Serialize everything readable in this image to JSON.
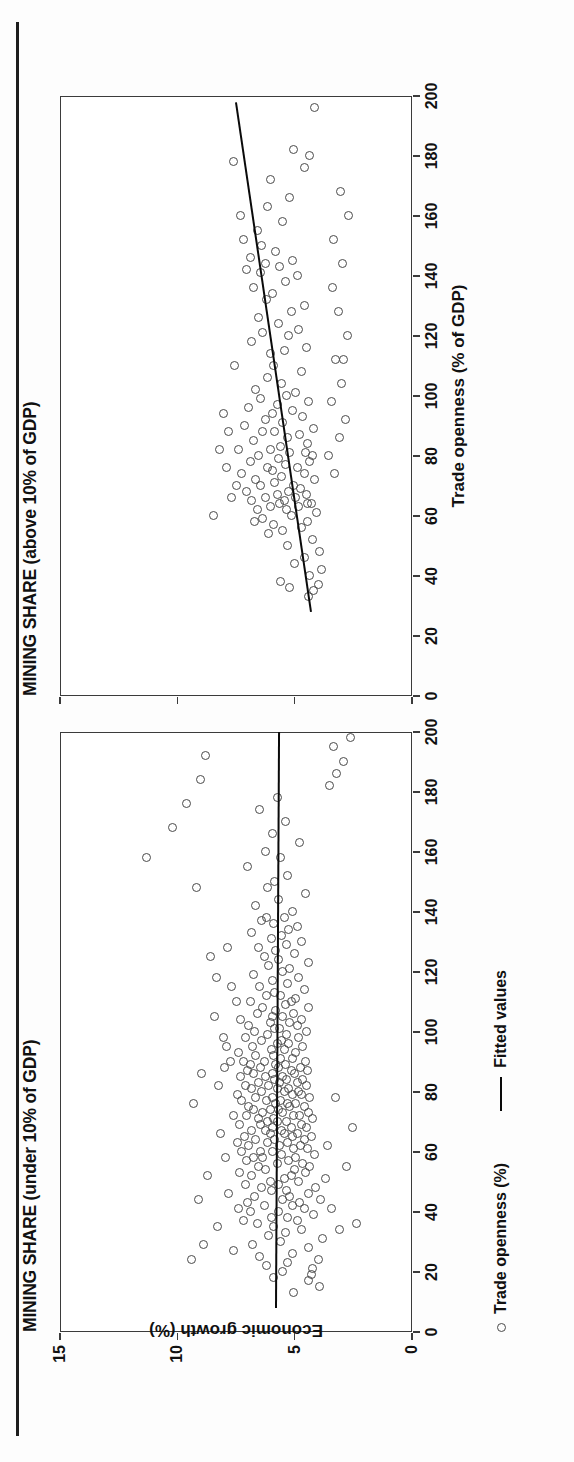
{
  "figure": {
    "xaxis_title": "Trade openness (% of GDP)",
    "yaxis_title": "Economic growth (%)"
  },
  "legend": {
    "items": [
      {
        "label": "Trade openness (%)",
        "marker": "circle-marker-icon"
      },
      {
        "label": "Fitted values",
        "marker": "line-marker-icon"
      }
    ]
  },
  "chart_data": [
    {
      "type": "scatter",
      "title": "MINING SHARE (under 10% of GDP)",
      "xlabel": "Trade openness (%)",
      "ylabel": "Economic growth (%)",
      "xlim": [
        0,
        200
      ],
      "ylim": [
        0,
        15
      ],
      "xticks": [
        0,
        20,
        40,
        60,
        80,
        100,
        120,
        140,
        160,
        180,
        200
      ],
      "yticks": [
        0,
        5,
        10,
        15
      ],
      "grid": false,
      "fit_line": {
        "x": [
          8,
          200
        ],
        "y": [
          5.85,
          5.72
        ]
      },
      "x": [
        13,
        15,
        17,
        18,
        19,
        20,
        21,
        22,
        23,
        24,
        25,
        26,
        27,
        28,
        29,
        30,
        31,
        32,
        33,
        34,
        35,
        35,
        36,
        37,
        37,
        38,
        38,
        39,
        40,
        40,
        41,
        41,
        42,
        42,
        43,
        43,
        44,
        44,
        45,
        45,
        46,
        46,
        47,
        47,
        48,
        48,
        49,
        49,
        50,
        50,
        51,
        51,
        52,
        52,
        53,
        53,
        54,
        54,
        55,
        55,
        56,
        56,
        57,
        57,
        58,
        58,
        58,
        59,
        59,
        60,
        60,
        60,
        61,
        61,
        62,
        62,
        62,
        63,
        63,
        63,
        64,
        64,
        64,
        65,
        65,
        65,
        66,
        66,
        66,
        67,
        67,
        67,
        68,
        68,
        68,
        69,
        69,
        69,
        70,
        70,
        70,
        71,
        71,
        71,
        72,
        72,
        72,
        73,
        73,
        73,
        74,
        74,
        74,
        75,
        75,
        75,
        76,
        76,
        76,
        77,
        77,
        77,
        78,
        78,
        78,
        79,
        79,
        79,
        80,
        80,
        80,
        81,
        81,
        81,
        82,
        82,
        82,
        83,
        83,
        83,
        84,
        84,
        84,
        85,
        85,
        85,
        86,
        86,
        86,
        87,
        87,
        87,
        88,
        88,
        88,
        89,
        89,
        89,
        90,
        90,
        90,
        91,
        91,
        92,
        92,
        93,
        93,
        94,
        94,
        95,
        95,
        96,
        96,
        97,
        97,
        98,
        98,
        99,
        99,
        100,
        100,
        101,
        101,
        102,
        102,
        103,
        103,
        104,
        104,
        105,
        105,
        106,
        106,
        107,
        108,
        108,
        109,
        110,
        110,
        111,
        112,
        112,
        113,
        114,
        115,
        116,
        117,
        118,
        119,
        120,
        121,
        122,
        123,
        124,
        125,
        126,
        127,
        128,
        129,
        130,
        131,
        132,
        133,
        134,
        135,
        136,
        137,
        138,
        140,
        142,
        144,
        146,
        148,
        150,
        152,
        155,
        158,
        160,
        163,
        166,
        170,
        174,
        178,
        182,
        186,
        190,
        195,
        198,
        34,
        36,
        41,
        55,
        62,
        68,
        78,
        88,
        95,
        105,
        115,
        125,
        58,
        66,
        72,
        82,
        90,
        98,
        110,
        118,
        128,
        138,
        148,
        158,
        168,
        176,
        184,
        192,
        24,
        29,
        44,
        52,
        76,
        86,
        102,
        112,
        122,
        132,
        142,
        152
      ],
      "y": [
        5.05,
        3.95,
        4.4,
        5.9,
        4.3,
        5.5,
        4.25,
        6.2,
        5.3,
        4.0,
        6.5,
        5.1,
        7.6,
        4.4,
        6.8,
        5.6,
        3.8,
        6.1,
        5.4,
        4.7,
        8.3,
        5.9,
        6.6,
        4.9,
        7.2,
        5.3,
        6.0,
        4.2,
        6.9,
        5.7,
        4.6,
        7.4,
        5.1,
        6.3,
        4.8,
        7.0,
        5.5,
        3.9,
        6.7,
        5.2,
        4.4,
        7.8,
        6.0,
        5.35,
        4.1,
        6.4,
        5.7,
        7.1,
        4.85,
        6.05,
        5.45,
        3.7,
        6.85,
        5.15,
        4.55,
        7.35,
        6.25,
        5.0,
        4.35,
        6.55,
        5.75,
        4.65,
        7.05,
        5.25,
        6.35,
        4.95,
        6.75,
        5.55,
        4.15,
        7.25,
        5.95,
        6.45,
        5.05,
        4.45,
        6.95,
        5.65,
        4.75,
        7.45,
        6.15,
        5.3,
        4.6,
        6.65,
        5.85,
        5.1,
        4.3,
        7.15,
        6.05,
        5.45,
        4.9,
        6.85,
        5.55,
        6.25,
        4.5,
        5.95,
        5.15,
        6.45,
        4.7,
        7.35,
        5.75,
        6.15,
        5.35,
        4.25,
        6.55,
        5.9,
        5.05,
        4.8,
        7.05,
        6.35,
        5.5,
        4.4,
        6.75,
        5.7,
        6.05,
        5.2,
        4.6,
        6.95,
        5.8,
        5.3,
        4.95,
        7.25,
        6.2,
        5.6,
        4.35,
        6.65,
        5.95,
        5.1,
        4.7,
        7.45,
        6.4,
        5.45,
        4.85,
        6.85,
        5.75,
        5.25,
        4.5,
        7.1,
        6.1,
        5.65,
        4.9,
        6.55,
        5.85,
        5.35,
        4.65,
        7.3,
        6.25,
        5.5,
        5.0,
        6.75,
        5.95,
        5.15,
        4.45,
        7.0,
        6.45,
        5.7,
        4.75,
        6.9,
        5.8,
        5.4,
        4.55,
        7.2,
        6.3,
        5.6,
        5.1,
        6.65,
        5.9,
        4.95,
        7.4,
        6.0,
        5.45,
        4.65,
        6.8,
        5.75,
        5.25,
        6.4,
        5.55,
        4.85,
        7.1,
        6.15,
        5.35,
        4.5,
        6.7,
        5.85,
        5.65,
        4.9,
        6.95,
        6.05,
        5.2,
        4.7,
        7.3,
        5.95,
        5.5,
        5.05,
        6.6,
        5.8,
        4.4,
        6.35,
        5.4,
        6.9,
        5.15,
        4.95,
        6.2,
        5.6,
        5.85,
        4.6,
        6.5,
        5.3,
        5.95,
        4.85,
        6.75,
        5.5,
        5.2,
        6.1,
        4.4,
        5.7,
        6.3,
        5.0,
        5.8,
        6.55,
        5.35,
        4.7,
        6.0,
        5.55,
        6.85,
        5.25,
        4.9,
        5.9,
        6.4,
        5.45,
        5.1,
        6.65,
        5.7,
        4.55,
        6.15,
        5.85,
        5.3,
        7.0,
        5.6,
        6.25,
        4.8,
        5.95,
        5.4,
        6.5,
        5.75,
        3.5,
        3.2,
        2.9,
        3.35,
        2.6,
        3.1,
        2.35,
        3.45,
        2.8,
        3.6,
        2.55,
        3.25,
        8.0,
        7.9,
        8.4,
        7.7,
        8.6,
        7.95,
        8.15,
        7.6,
        8.25,
        7.75,
        8.05,
        7.5,
        8.35,
        7.85,
        6.2,
        9.2,
        11.3,
        10.2,
        9.6,
        9.0,
        8.8,
        9.4,
        8.9,
        9.1,
        8.7,
        9.3,
        8.95
      ]
    },
    {
      "type": "scatter",
      "title": "MINING SHARE (above 10% of GDP)",
      "xlabel": "Trade openness (% of GDP)",
      "ylabel": "Economic growth (%)",
      "xlim": [
        0,
        200
      ],
      "ylim": [
        0,
        15
      ],
      "xticks": [
        0,
        20,
        40,
        60,
        80,
        100,
        120,
        140,
        160,
        180,
        200
      ],
      "yticks": [
        0,
        5,
        10,
        15
      ],
      "grid": false,
      "fit_line": {
        "x": [
          28,
          198
        ],
        "y": [
          4.35,
          7.55
        ]
      },
      "x": [
        33,
        35,
        36,
        37,
        38,
        40,
        42,
        44,
        46,
        48,
        50,
        52,
        54,
        55,
        56,
        57,
        58,
        59,
        60,
        61,
        62,
        62,
        63,
        63,
        64,
        64,
        65,
        65,
        66,
        66,
        67,
        67,
        68,
        68,
        69,
        70,
        70,
        71,
        72,
        72,
        73,
        74,
        74,
        75,
        76,
        76,
        77,
        78,
        78,
        79,
        80,
        80,
        81,
        81,
        82,
        82,
        83,
        84,
        85,
        86,
        87,
        88,
        88,
        89,
        90,
        91,
        92,
        93,
        94,
        95,
        96,
        97,
        98,
        99,
        100,
        101,
        102,
        104,
        106,
        108,
        110,
        110,
        112,
        114,
        115,
        116,
        118,
        120,
        121,
        122,
        124,
        126,
        128,
        130,
        132,
        134,
        136,
        138,
        140,
        141,
        142,
        143,
        144,
        145,
        146,
        148,
        150,
        152,
        155,
        158,
        160,
        163,
        166,
        172,
        176,
        178,
        180,
        182,
        196,
        58,
        64,
        70,
        76,
        82,
        88,
        94,
        60,
        66,
        74,
        80,
        86,
        92,
        98,
        104,
        112,
        120,
        128,
        136,
        144,
        152,
        160,
        168
      ],
      "y": [
        4.4,
        4.2,
        5.2,
        4.0,
        5.6,
        4.35,
        3.85,
        5.0,
        4.6,
        3.95,
        5.3,
        4.25,
        6.1,
        5.5,
        4.7,
        5.9,
        4.45,
        6.35,
        5.15,
        4.05,
        6.6,
        5.35,
        4.85,
        6.05,
        5.65,
        4.3,
        6.85,
        5.45,
        4.95,
        6.25,
        5.75,
        4.5,
        7.05,
        5.25,
        4.75,
        6.45,
        5.05,
        5.85,
        4.15,
        6.65,
        5.55,
        4.6,
        7.25,
        5.95,
        4.9,
        6.15,
        5.4,
        4.35,
        6.9,
        5.7,
        4.25,
        6.55,
        5.2,
        4.55,
        7.4,
        6.05,
        5.6,
        4.45,
        6.75,
        5.3,
        4.8,
        6.35,
        5.85,
        4.2,
        7.15,
        5.5,
        6.25,
        4.65,
        5.95,
        5.1,
        6.95,
        5.75,
        4.4,
        6.45,
        5.35,
        4.95,
        6.65,
        5.55,
        6.15,
        4.7,
        5.9,
        7.55,
        2.9,
        6.05,
        5.45,
        4.5,
        6.85,
        5.25,
        6.35,
        4.85,
        5.7,
        6.55,
        5.15,
        4.6,
        6.2,
        5.95,
        6.75,
        5.4,
        4.9,
        6.45,
        7.05,
        5.65,
        6.25,
        5.1,
        6.9,
        5.8,
        6.4,
        7.2,
        6.6,
        5.5,
        7.3,
        6.15,
        5.2,
        6.05,
        4.6,
        7.6,
        4.35,
        5.05,
        4.15,
        6.7,
        4.45,
        7.5,
        7.9,
        8.2,
        7.8,
        8.05,
        8.45,
        7.7,
        3.3,
        3.55,
        3.1,
        2.85,
        3.45,
        3.0,
        3.25,
        2.75,
        3.15,
        3.4,
        2.95,
        3.35,
        2.7,
        3.05,
        3.5,
        2.6
      ]
    }
  ]
}
